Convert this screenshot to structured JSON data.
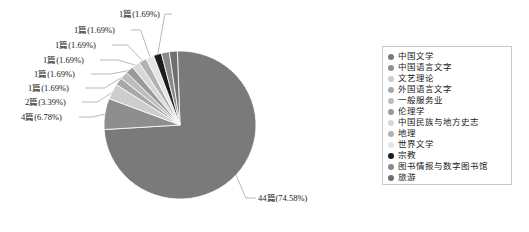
{
  "chart_data": {
    "type": "pie",
    "title": "",
    "unit": "篇",
    "total": 59,
    "legend_position": "right",
    "grid": false,
    "categories": [
      "中国文学",
      "中国语言文字",
      "文艺理论",
      "外国语言文字",
      "一般服务业",
      "伦理学",
      "中国民族与地方史志",
      "地理",
      "世界文学",
      "宗教",
      "图书情报与数字图书馆",
      "旅游"
    ],
    "values": [
      44,
      4,
      2,
      1,
      1,
      1,
      1,
      1,
      1,
      1,
      1,
      1
    ],
    "percents": [
      74.58,
      6.78,
      3.39,
      1.69,
      1.69,
      1.69,
      1.69,
      1.69,
      1.69,
      1.69,
      1.69,
      1.69
    ],
    "slice_colors": [
      "#7a7a7a",
      "#8e8e8e",
      "#cdcdcd",
      "#a8a8a8",
      "#bdbdbd",
      "#9a9a9a",
      "#d8d8d8",
      "#b2b2b2",
      "#e4e4e4",
      "#1c1c1c",
      "#8a8a8a",
      "#6f6f6f"
    ],
    "data_labels": [
      "44篇(74.58%)",
      "4篇(6.78%)",
      "2篇(3.39%)",
      "1篇(1.69%)",
      "1篇(1.69%)",
      "1篇(1.69%)",
      "1篇(1.69%)",
      "1篇(1.69%)",
      "1篇(1.69%)"
    ]
  },
  "pie": {
    "callouts": [
      {
        "text": "1篇(1.69%)"
      },
      {
        "text": "1篇(1.69%)"
      },
      {
        "text": "1篇(1.69%)"
      },
      {
        "text": "1篇(1.69%)"
      },
      {
        "text": "1篇(1.69%)"
      },
      {
        "text": "1篇(1.69%)"
      },
      {
        "text": "2篇(3.39%)"
      },
      {
        "text": "4篇(6.78%)"
      },
      {
        "text": "44篇(74.58%)"
      }
    ]
  },
  "legend": {
    "items": [
      {
        "label": "中国文学",
        "color": "#7a7a7a"
      },
      {
        "label": "中国语言文字",
        "color": "#8e8e8e"
      },
      {
        "label": "文艺理论",
        "color": "#cdcdcd"
      },
      {
        "label": "外国语言文字",
        "color": "#a8a8a8"
      },
      {
        "label": "一般服务业",
        "color": "#bdbdbd"
      },
      {
        "label": "伦理学",
        "color": "#9a9a9a"
      },
      {
        "label": "中国民族与地方史志",
        "color": "#d8d8d8"
      },
      {
        "label": "地理",
        "color": "#b2b2b2"
      },
      {
        "label": "世界文学",
        "color": "#e4e4e4"
      },
      {
        "label": "宗教",
        "color": "#1c1c1c"
      },
      {
        "label": "图书情报与数字图书馆",
        "color": "#8a8a8a"
      },
      {
        "label": "旅游",
        "color": "#6f6f6f"
      }
    ]
  },
  "colors": {
    "background": "#ffffff",
    "text": "#1a1a1a",
    "legend_border": "#c8c8c8",
    "leader_line": "#9b9b9b"
  }
}
